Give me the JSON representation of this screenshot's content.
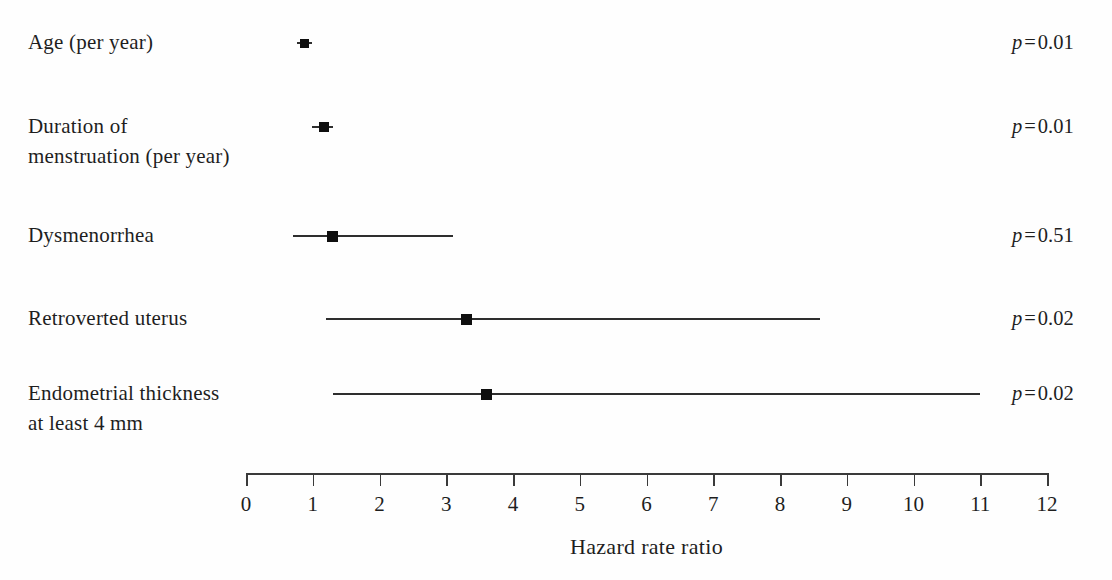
{
  "figure": {
    "background": "#fefefe",
    "text_color": "#1e1e1e",
    "line_color": "#3a3a3a",
    "marker_color": "#0f0f0f"
  },
  "chart_data": {
    "type": "scatter",
    "subtype": "forest-plot",
    "title": "",
    "xlabel": "Hazard rate ratio",
    "ylabel": "",
    "xlim": [
      0,
      12
    ],
    "x_ticks": [
      0,
      1,
      2,
      3,
      4,
      5,
      6,
      7,
      8,
      9,
      10,
      11,
      12
    ],
    "grid": false,
    "legend": false,
    "p_prefix": "p",
    "p_equals": "=",
    "rows": [
      {
        "label_lines": [
          "Age (per year)"
        ],
        "estimate": 0.88,
        "ci_low": 0.77,
        "ci_high": 0.99,
        "p_value": "0.01"
      },
      {
        "label_lines": [
          "Duration of",
          "menstruation (per year)"
        ],
        "estimate": 1.17,
        "ci_low": 0.99,
        "ci_high": 1.31,
        "p_value": "0.01"
      },
      {
        "label_lines": [
          "Dysmenorrhea"
        ],
        "estimate": 1.3,
        "ci_low": 0.7,
        "ci_high": 3.1,
        "p_value": "0.51"
      },
      {
        "label_lines": [
          "Retroverted uterus"
        ],
        "estimate": 3.3,
        "ci_low": 1.2,
        "ci_high": 8.6,
        "p_value": "0.02"
      },
      {
        "label_lines": [
          "Endometrial thickness",
          "at least 4 mm"
        ],
        "estimate": 3.6,
        "ci_low": 1.3,
        "ci_high": 11.0,
        "p_value": "0.02"
      }
    ]
  }
}
